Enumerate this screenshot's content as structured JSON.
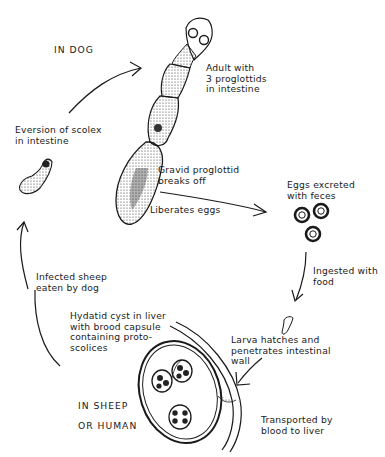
{
  "diagram": {
    "type": "life-cycle",
    "hosts": {
      "definitive": "IN DOG",
      "intermediate_line1": "IN SHEEP",
      "intermediate_line2": "OR HUMAN"
    },
    "stages": [
      {
        "id": "adult",
        "label": "Adult with\n3 proglottids\nin intestine"
      },
      {
        "id": "gravid",
        "label": "Gravid proglottid\nbreaks off"
      },
      {
        "id": "liberates",
        "label": "Liberates eggs"
      },
      {
        "id": "eggs",
        "label": "Eggs excreted\nwith feces"
      },
      {
        "id": "ingested",
        "label": "Ingested with\nfood"
      },
      {
        "id": "larva",
        "label": "Larva hatches and\npenetrates intestinal\nwall"
      },
      {
        "id": "transported",
        "label": "Transported by\nblood to liver"
      },
      {
        "id": "cyst",
        "label": "Hydatid cyst in liver\nwith brood capsule\ncontaining proto-\nscolices"
      },
      {
        "id": "infected",
        "label": "Infected sheep\neaten by dog"
      },
      {
        "id": "eversion",
        "label": "Eversion of scolex\nin intestine"
      }
    ],
    "flow": [
      "eversion",
      "adult",
      "gravid",
      "eggs",
      "ingested",
      "larva",
      "transported",
      "cyst",
      "infected",
      "eversion"
    ],
    "colors": {
      "ink": "#1a1a1a",
      "background": "#ffffff"
    }
  }
}
